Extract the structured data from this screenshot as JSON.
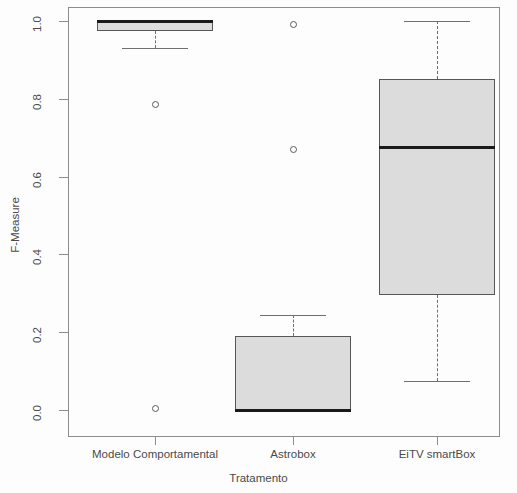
{
  "chart_data": {
    "type": "box",
    "title": "",
    "xlabel": "Tratamento",
    "ylabel": "F-Measure",
    "ylim": [
      0.0,
      1.0
    ],
    "ytick_labels": [
      "1.0",
      "0.8",
      "0.6",
      "0.4",
      "0.2",
      "0.0"
    ],
    "ytick_values": [
      1.0,
      0.8,
      0.6,
      0.4,
      0.2,
      0.0
    ],
    "grid": false,
    "legend": "none",
    "categories": [
      "Modelo Comportamental",
      "Astrobox",
      "EiTV smartBox"
    ],
    "boxes": [
      {
        "label": "Modelo Comportamental",
        "whisker_low": 0.93,
        "q1": 0.975,
        "median": 1.0,
        "q3": 1.0,
        "whisker_high": 1.0,
        "outliers": [
          0.785,
          0.005
        ]
      },
      {
        "label": "Astrobox",
        "whisker_low": 0.0,
        "q1": 0.0,
        "median": 0.0,
        "q3": 0.19,
        "whisker_high": 0.245,
        "outliers": [
          0.99,
          0.67
        ]
      },
      {
        "label": "EiTV smartBox",
        "whisker_low": 0.075,
        "q1": 0.295,
        "median": 0.675,
        "q3": 0.85,
        "whisker_high": 1.0,
        "outliers": []
      }
    ],
    "colors": {
      "box_fill": "#dcdcdc",
      "box_border": "#575757",
      "median": "#1a1a1a",
      "whisker": "#6f6f6f",
      "axis": "#8d8d8d",
      "text": "#4a4a4a",
      "background": "#fdfdfd"
    }
  }
}
